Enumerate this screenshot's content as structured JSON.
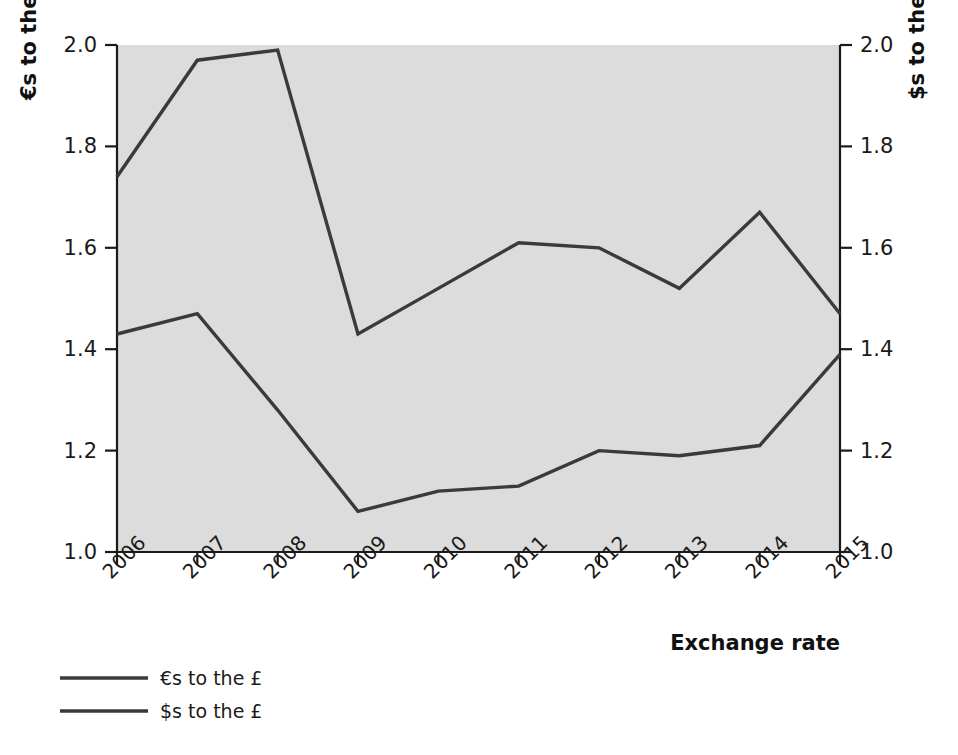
{
  "chart_data": {
    "type": "line",
    "title": "",
    "xlabel": "Exchange rate",
    "ylabel": "€s to the £",
    "y2label": "$s to the £",
    "categories": [
      "2006",
      "2007",
      "2008",
      "2009",
      "2010",
      "2011",
      "2012",
      "2013",
      "2014",
      "2015"
    ],
    "ylim": [
      1.0,
      2.0
    ],
    "yticks": [
      "1.0",
      "1.2",
      "1.4",
      "1.6",
      "1.8",
      "2.0"
    ],
    "ytick_values": [
      1.0,
      1.2,
      1.4,
      1.6,
      1.8,
      2.0
    ],
    "y2lim": [
      1.0,
      2.0
    ],
    "y2ticks": [
      "1.0",
      "1.2",
      "1.4",
      "1.6",
      "1.8",
      "2.0"
    ],
    "grid": false,
    "legend_position": "below-left",
    "plot_background": "#dcdcdc",
    "line_color": "#3a3a3a",
    "series": [
      {
        "name": "€s to the £",
        "values": [
          1.74,
          1.97,
          1.99,
          1.43,
          1.52,
          1.61,
          1.6,
          1.52,
          1.67,
          1.47
        ]
      },
      {
        "name": "$s to the £",
        "values": [
          1.43,
          1.47,
          1.28,
          1.08,
          1.12,
          1.13,
          1.2,
          1.19,
          1.21,
          1.39
        ]
      }
    ]
  },
  "axes": {
    "left_title": "€s to the £",
    "right_title": "$s to the £",
    "bottom_title": "Exchange rate"
  },
  "legend": {
    "items": [
      {
        "label": "€s to the £"
      },
      {
        "label": "$s to the £"
      }
    ]
  }
}
